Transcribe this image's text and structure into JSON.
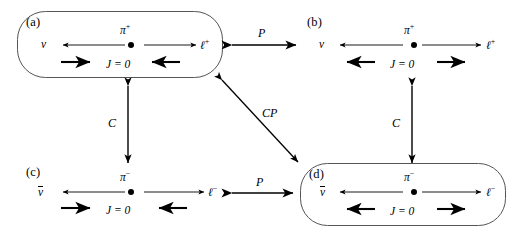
{
  "figure": {
    "caption_present": false,
    "background_color": "#ffffff",
    "ink_color": "#000000",
    "width": 517,
    "height": 233
  },
  "panels": [
    {
      "id": "a",
      "tag": "(a)",
      "boxed": true,
      "meson": "π",
      "meson_charge": "+",
      "left_particle": "ν",
      "left_particle_bar": false,
      "right_particle": "ℓ",
      "right_particle_charge": "+",
      "spin_label": "J = 0",
      "momentum_left_direction": "left",
      "momentum_right_direction": "right",
      "spin_left_direction": "right",
      "spin_right_direction": "left"
    },
    {
      "id": "b",
      "tag": "(b)",
      "boxed": false,
      "meson": "π",
      "meson_charge": "+",
      "left_particle": "ν",
      "left_particle_bar": false,
      "right_particle": "ℓ",
      "right_particle_charge": "+",
      "spin_label": "J = 0",
      "momentum_left_direction": "left",
      "momentum_right_direction": "right",
      "spin_left_direction": "left",
      "spin_right_direction": "right"
    },
    {
      "id": "c",
      "tag": "(c)",
      "boxed": false,
      "meson": "π",
      "meson_charge": "−",
      "left_particle": "ν",
      "left_particle_bar": true,
      "right_particle": "ℓ",
      "right_particle_charge": "−",
      "spin_label": "J = 0",
      "momentum_left_direction": "left",
      "momentum_right_direction": "right",
      "spin_left_direction": "right",
      "spin_right_direction": "left"
    },
    {
      "id": "d",
      "tag": "(d)",
      "boxed": true,
      "meson": "π",
      "meson_charge": "−",
      "left_particle": "ν",
      "left_particle_bar": true,
      "right_particle": "ℓ",
      "right_particle_charge": "−",
      "spin_label": "J = 0",
      "momentum_left_direction": "left",
      "momentum_right_direction": "right",
      "spin_left_direction": "left",
      "spin_right_direction": "right"
    }
  ],
  "transformations": [
    {
      "id": "p-top",
      "label": "P",
      "from": "a",
      "to": "b",
      "orientation": "horizontal",
      "double_headed": true
    },
    {
      "id": "p-bottom",
      "label": "P",
      "from": "c",
      "to": "d",
      "orientation": "horizontal",
      "double_headed": true
    },
    {
      "id": "c-left",
      "label": "C",
      "from": "a",
      "to": "c",
      "orientation": "vertical",
      "double_headed": true
    },
    {
      "id": "c-right",
      "label": "C",
      "from": "b",
      "to": "d",
      "orientation": "vertical",
      "double_headed": true
    },
    {
      "id": "cp-diag",
      "label": "CP",
      "from": "a",
      "to": "d",
      "orientation": "diagonal",
      "double_headed": true
    }
  ]
}
